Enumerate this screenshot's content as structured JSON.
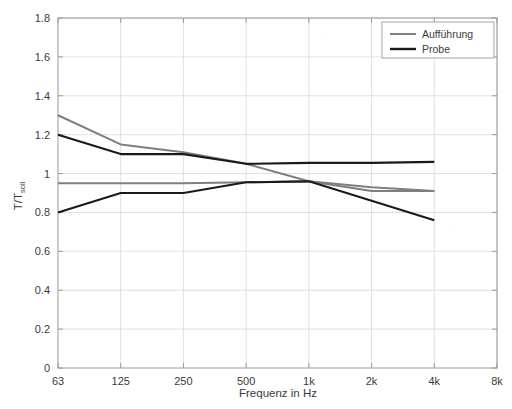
{
  "chart_data": {
    "type": "line",
    "title": "",
    "subtitle": "",
    "xlabel": "Frequenz in Hz",
    "ylabel": "T/T_soll",
    "ylabel_main": "T/T",
    "ylabel_sub": "soll",
    "categories": [
      "63",
      "125",
      "250",
      "500",
      "1k",
      "2k",
      "4k",
      "8k"
    ],
    "x_tick_labels": [
      "63",
      "125",
      "250",
      "500",
      "1k",
      "2k",
      "4k",
      "8k"
    ],
    "y_tick_labels": [
      "0",
      "0.2",
      "0.4",
      "0.6",
      "0.8",
      "1",
      "1.2",
      "1.4",
      "1.6",
      "1.8"
    ],
    "y_tick_values": [
      0,
      0.2,
      0.4,
      0.6,
      0.8,
      1,
      1.2,
      1.4,
      1.6,
      1.8
    ],
    "ylim": [
      0,
      1.8
    ],
    "xlim_categories": [
      "63",
      "8k"
    ],
    "grid": true,
    "legend_position": "top-right",
    "legend_entries": [
      "Aufführung",
      "Probe"
    ],
    "series": [
      {
        "name": "Aufführung",
        "role": "upper-tolerance",
        "color": "#7f7f7f",
        "x": [
          "63",
          "125",
          "250",
          "500",
          "1k",
          "2k",
          "4k"
        ],
        "values": [
          1.3,
          1.15,
          1.11,
          1.05,
          0.96,
          0.93,
          0.91
        ]
      },
      {
        "name": "Aufführung",
        "role": "lower-tolerance",
        "color": "#7f7f7f",
        "x": [
          "63",
          "125",
          "250",
          "500",
          "1k",
          "2k",
          "4k"
        ],
        "values": [
          0.95,
          0.95,
          0.95,
          0.955,
          0.96,
          0.91,
          0.91
        ]
      },
      {
        "name": "Probe",
        "role": "upper-tolerance",
        "color": "#1a1a1a",
        "x": [
          "63",
          "125",
          "250",
          "500",
          "1k",
          "2k",
          "4k"
        ],
        "values": [
          1.2,
          1.1,
          1.1,
          1.05,
          1.055,
          1.055,
          1.06
        ]
      },
      {
        "name": "Probe",
        "role": "lower-tolerance",
        "color": "#1a1a1a",
        "x": [
          "63",
          "125",
          "250",
          "500",
          "1k",
          "2k",
          "4k"
        ],
        "values": [
          0.8,
          0.9,
          0.9,
          0.955,
          0.96,
          0.86,
          0.76
        ]
      }
    ],
    "colors": {
      "auffuehrung": "#7f7f7f",
      "probe": "#1a1a1a",
      "grid": "#d8d8d8",
      "axis": "#9a9a9a",
      "text": "#3b3b3b",
      "background": "#ffffff"
    }
  }
}
